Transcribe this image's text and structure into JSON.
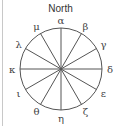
{
  "diagram": {
    "title": "North",
    "center": [
      61,
      69
    ],
    "radius": 41,
    "spoke_count": 12,
    "line_color": "#555555",
    "labels": [
      {
        "text": "α",
        "angle": 0
      },
      {
        "text": "β",
        "angle": 30
      },
      {
        "text": "γ",
        "angle": 60
      },
      {
        "text": "δ",
        "angle": 90
      },
      {
        "text": "ε",
        "angle": 120
      },
      {
        "text": "ζ",
        "angle": 150
      },
      {
        "text": "η",
        "angle": 180
      },
      {
        "text": "θ",
        "angle": 210
      },
      {
        "text": "ι",
        "angle": 240
      },
      {
        "text": "κ",
        "angle": 270
      },
      {
        "text": "λ",
        "angle": 300
      },
      {
        "text": "μ",
        "angle": 330
      }
    ]
  }
}
